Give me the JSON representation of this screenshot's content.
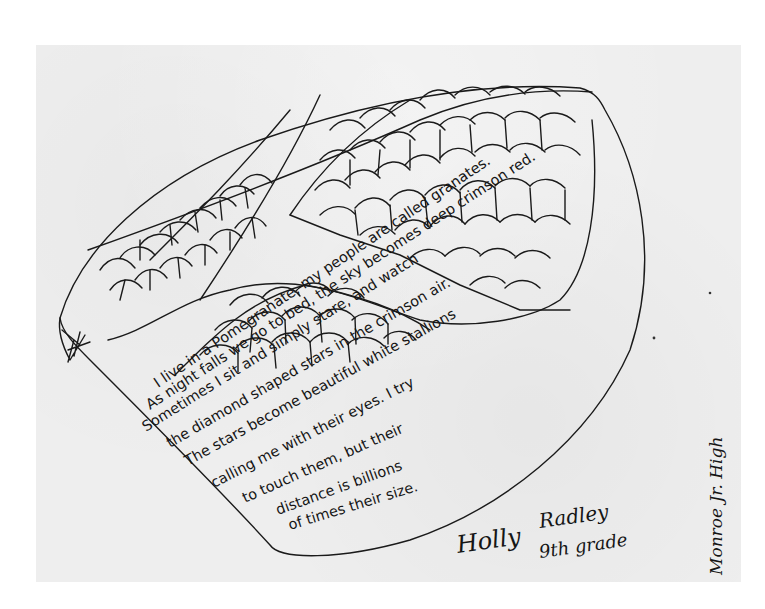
{
  "artwork": {
    "subject": "pomegranate drawing with poem",
    "poem_lines": [
      "I live in a Pomegranate, my people are called granates.",
      "As night falls we go to bed, the sky becomes deep crimson red.",
      "Sometimes I sit and simply stare, and watch",
      "the diamond shaped stars in the crimson air.",
      "The stars become beautiful white stallions",
      "calling me with their eyes. I try",
      "to touch them, but their",
      "distance is billions",
      "of times their size."
    ],
    "author": {
      "first_name": "Holly",
      "last_name": "Radley",
      "grade": "9th grade"
    },
    "school": "Monroe Jr. High"
  },
  "colors": {
    "paper": "#eeeeee",
    "background": "#ffffff",
    "ink": "#1a1a1a"
  }
}
